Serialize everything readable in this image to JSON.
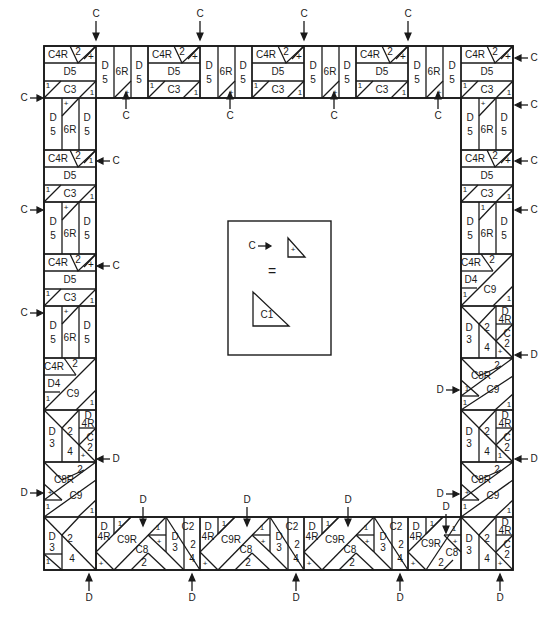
{
  "diagram": {
    "frame": {
      "left": 44,
      "top": 46,
      "right": 513,
      "bottom": 570,
      "band": 52
    },
    "colors": {
      "ink": "#1a1a1a",
      "paper": "#ffffff"
    }
  },
  "labels": {
    "c4r": "C4R",
    "d5": "D5",
    "d": "D",
    "five": "5",
    "six_r": "6R",
    "c3": "C3",
    "one": "1",
    "two": "2",
    "plus": "+",
    "d4": "D4",
    "c9": "C9",
    "d3_top": "D",
    "d3_bot": "3",
    "four": "4",
    "four_r": "4R",
    "c2": "C2",
    "c_lbl": "C",
    "two_lbl": "2",
    "c8r": "C8R",
    "c9r": "C9R",
    "c8": "C8"
  },
  "legend": {
    "arrow_label": "C",
    "equals": "=",
    "small_piece": "+",
    "large_piece": "C1"
  },
  "annotations": {
    "c": "C",
    "d": "D",
    "top_arrows": [
      {
        "x": 96,
        "y": 14,
        "label": "C",
        "dir": "down"
      },
      {
        "x": 200,
        "y": 14,
        "label": "C",
        "dir": "down"
      },
      {
        "x": 304,
        "y": 14,
        "label": "C",
        "dir": "down"
      },
      {
        "x": 408,
        "y": 14,
        "label": "C",
        "dir": "down"
      }
    ],
    "below_top_arrows": [
      {
        "x": 126,
        "y": 116,
        "label": "C",
        "dir": "up"
      },
      {
        "x": 230,
        "y": 116,
        "label": "C",
        "dir": "up"
      },
      {
        "x": 334,
        "y": 116,
        "label": "C",
        "dir": "up"
      },
      {
        "x": 438,
        "y": 116,
        "label": "C",
        "dir": "up"
      }
    ],
    "left_arrows": [
      {
        "x": 30,
        "y": 98,
        "label": "C",
        "dir": "right"
      },
      {
        "x": 30,
        "y": 210,
        "label": "C",
        "dir": "right"
      },
      {
        "x": 30,
        "y": 313,
        "label": "C",
        "dir": "right"
      },
      {
        "x": 30,
        "y": 493,
        "label": "D",
        "dir": "right"
      }
    ],
    "inner_left_arrows": [
      {
        "x": 110,
        "y": 161,
        "label": "C",
        "dir": "left"
      },
      {
        "x": 110,
        "y": 266,
        "label": "C",
        "dir": "left"
      },
      {
        "x": 110,
        "y": 459,
        "label": "D",
        "dir": "left"
      }
    ],
    "right_arrows": [
      {
        "x": 528,
        "y": 58,
        "label": "C",
        "dir": "left"
      },
      {
        "x": 528,
        "y": 105,
        "label": "C",
        "dir": "left"
      },
      {
        "x": 528,
        "y": 161,
        "label": "C",
        "dir": "left"
      },
      {
        "x": 528,
        "y": 210,
        "label": "C",
        "dir": "left"
      },
      {
        "x": 528,
        "y": 355,
        "label": "D",
        "dir": "left"
      },
      {
        "x": 528,
        "y": 459,
        "label": "D",
        "dir": "left"
      }
    ],
    "inner_right_arrows": [
      {
        "x": 446,
        "y": 390,
        "label": "D",
        "dir": "right"
      },
      {
        "x": 446,
        "y": 494,
        "label": "D",
        "dir": "right"
      },
      {
        "x": 446,
        "y": 507,
        "label": "D",
        "dir": "down"
      }
    ],
    "above_bottom_arrows": [
      {
        "x": 143,
        "y": 500,
        "label": "D",
        "dir": "down"
      },
      {
        "x": 247,
        "y": 500,
        "label": "D",
        "dir": "down"
      },
      {
        "x": 348,
        "y": 500,
        "label": "D",
        "dir": "down"
      }
    ],
    "bottom_arrows": [
      {
        "x": 89,
        "y": 598,
        "label": "D",
        "dir": "up"
      },
      {
        "x": 192,
        "y": 598,
        "label": "D",
        "dir": "up"
      },
      {
        "x": 296,
        "y": 598,
        "label": "D",
        "dir": "up"
      },
      {
        "x": 400,
        "y": 598,
        "label": "D",
        "dir": "up"
      },
      {
        "x": 500,
        "y": 598,
        "label": "D",
        "dir": "up"
      }
    ]
  }
}
